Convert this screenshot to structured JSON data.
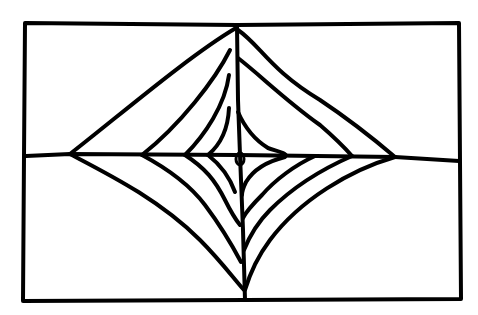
{
  "drawing": {
    "title": "Hand-drawn nested diamond / spider web pattern in rectangle",
    "background": "#ffffff",
    "ink_color": "#000000",
    "stroke_width": 4,
    "frame": {
      "x1": 24,
      "y1": 22,
      "x2": 460,
      "y2": 300
    },
    "horizontal_axis_y": 155,
    "vertical_axis_x": 238,
    "nested_shapes": 4
  }
}
